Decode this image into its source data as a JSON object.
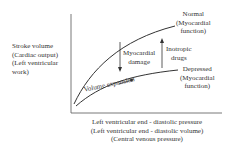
{
  "y_label": [
    "Stroke volume",
    "(Cardiac output)",
    "(Left ventricular",
    "work)"
  ],
  "x_label": [
    "Left ventricular end - diastolic pressure",
    "(Left ventricular end - diastolic volume)",
    "(Central venous pressure)"
  ],
  "normal_curve": [
    "Normal",
    "(Myocardial",
    "function)"
  ],
  "depressed_curve": [
    "Depressed",
    "(Myocardial",
    "function)"
  ],
  "myocardial_damage": [
    "Myocardial",
    "damage"
  ],
  "inotropic_drugs": [
    "Inotropic",
    "drugs"
  ],
  "volume_expansion": "Volume expansion"
}
